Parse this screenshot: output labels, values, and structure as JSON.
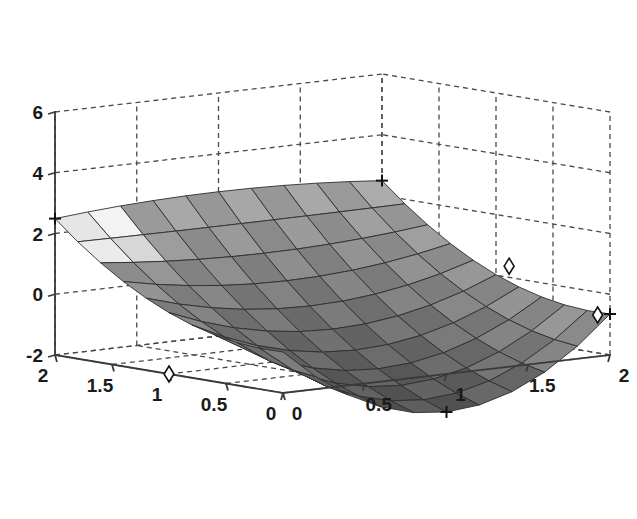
{
  "figure": {
    "background_color": "#ffffff",
    "axis_color": "#3a3a3a",
    "grid_color": "#4a4a4a",
    "grid_style": "dashed",
    "grid_visible": true,
    "box_visible": true,
    "projection": "3d-perspective",
    "view_azimuth": -37.5,
    "view_elevation": 30
  },
  "chart_data": {
    "type": "surface",
    "title": "",
    "subtitle": "",
    "xlabel": "",
    "ylabel": "",
    "zlabel": "",
    "colormap": "gray",
    "shading": "faceted",
    "mesh_nx": 11,
    "mesh_ny": 11,
    "x": [
      0,
      0.2,
      0.4,
      0.6,
      0.8,
      1.0,
      1.2,
      1.4,
      1.6,
      1.8,
      2.0
    ],
    "y": [
      0,
      0.2,
      0.4,
      0.6,
      0.8,
      1.0,
      1.2,
      1.4,
      1.6,
      1.8,
      2.0
    ],
    "xlim": [
      0,
      2
    ],
    "ylim": [
      0,
      2
    ],
    "zlim": [
      -2,
      6
    ],
    "xticks": [
      0,
      0.5,
      1,
      1.5,
      2
    ],
    "yticks": [
      0,
      0.5,
      1,
      1.5,
      2
    ],
    "zticks": [
      -2,
      0,
      2,
      4,
      6
    ],
    "xtick_labels": [
      "0",
      "0.5",
      "1",
      "1.5",
      "2"
    ],
    "ytick_labels": [
      "0",
      "0.5",
      "1",
      "1.5",
      "2"
    ],
    "ztick_labels": [
      "-2",
      "0",
      "2",
      "4",
      "6"
    ],
    "surface_description": "saddle-shaped surface, peaks near 5 at the x=0,y=2 and x=2,y=2 corners, dips to about -2 near the front x=1.2,y=0 region, and rises again toward x=2,y=0",
    "z_corner_values": {
      "x0_y0": 1.0,
      "x0_y2": 5.0,
      "x2_y0": -1.0,
      "x2_y2": 5.0
    },
    "z_min": -2.0,
    "z_max": 5.0,
    "markers": [
      {
        "symbol": "plus",
        "label": "",
        "position_note": "left peak on z-axis near z=5"
      },
      {
        "symbol": "plus",
        "label": "",
        "position_note": "back ridge corner near z=5"
      },
      {
        "symbol": "plus",
        "label": "",
        "position_note": "front low point of surface"
      },
      {
        "symbol": "plus",
        "label": "",
        "position_note": "right corner x=2,y=0"
      },
      {
        "symbol": "diamond",
        "label": "",
        "position_note": "upper right above surface edge"
      },
      {
        "symbol": "diamond",
        "label": "",
        "position_note": "lower right on surface edge"
      },
      {
        "symbol": "diamond",
        "label": "",
        "position_note": "on left y-axis near y=1"
      }
    ]
  }
}
